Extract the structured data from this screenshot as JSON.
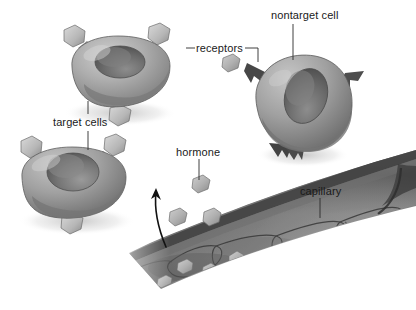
{
  "figure": {
    "background_color": "#ffffff",
    "palette": {
      "cell_light": "#d4d4d4",
      "cell_mid": "#9a9a9a",
      "cell_dark": "#6e6e6e",
      "nucleus_dark": "#5a5a5a",
      "receptor_fill": "#c8c8c8",
      "spike_dark": "#4a4a4a",
      "capillary_mid": "#8f8f8f",
      "capillary_dark": "#525252",
      "hormone_fill": "#b4b4b4",
      "leader_line": "#333333",
      "text": "#1a1a1a"
    },
    "labels": [
      {
        "id": "nontarget-cell",
        "text": "nontarget cell",
        "x": 271,
        "y": 9
      },
      {
        "id": "receptors",
        "text": "receptors",
        "x": 196,
        "y": 42
      },
      {
        "id": "target-cells",
        "text": "target cells",
        "x": 53,
        "y": 116
      },
      {
        "id": "hormone",
        "text": "hormone",
        "x": 176,
        "y": 146
      },
      {
        "id": "capillary",
        "text": "capillary",
        "x": 300,
        "y": 185
      }
    ],
    "structures": [
      {
        "id": "target-cell-upper",
        "kind": "target cell",
        "receptor_count": 3
      },
      {
        "id": "target-cell-lower",
        "kind": "target cell",
        "receptor_count": 3
      },
      {
        "id": "nontarget-cell",
        "kind": "nontarget cell",
        "spike_count": 4
      },
      {
        "id": "capillary-vessel",
        "kind": "capillary",
        "endothelial_segments": 7
      },
      {
        "id": "diffusion-arrow",
        "kind": "curved arrow",
        "direction": "capillary to target cells"
      }
    ],
    "hormone_particles_free": 4,
    "hormone_particles_in_capillary": 5
  }
}
